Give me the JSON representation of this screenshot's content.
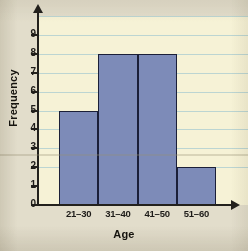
{
  "chart_data": {
    "type": "bar",
    "title": "",
    "xlabel": "Age",
    "ylabel": "Frequency",
    "categories": [
      "21–30",
      "31–40",
      "41–50",
      "51–60"
    ],
    "values": [
      5,
      8,
      8,
      2
    ],
    "ylim": [
      0,
      9
    ],
    "ytick_labels": [
      "0",
      "1",
      "2",
      "3",
      "4",
      "5",
      "6",
      "7",
      "8",
      "9"
    ],
    "grid": true,
    "legend": "none",
    "bar_gap": 0,
    "colors": {
      "bar_fill": "#7d8bb8",
      "bar_border": "#1b1f38",
      "plot_background": "#f6f2d6",
      "page_background": "#e2ddcb",
      "gridline": "#bcd5d2",
      "axis": "#23211d",
      "text": "#16140f"
    }
  }
}
